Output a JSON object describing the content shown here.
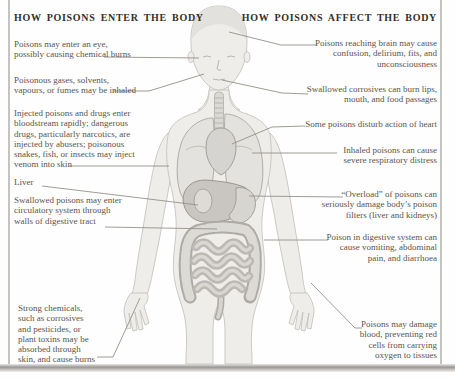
{
  "colors": {
    "page_background": "#fefefe",
    "frame_line": "#b3b1ae",
    "heading_text": "#332f29",
    "label_text": "#5a544a",
    "leader_line": "#95918a",
    "body_fill": "#efedea",
    "body_outline": "#c6c4c0",
    "organ_outline": "#9c9893",
    "organ_fill_light": "#dddbd6",
    "organ_fill_dark": "#c9c6c1"
  },
  "left_panel": {
    "heading": "HOW POISONS ENTER THE BODY",
    "items": [
      {
        "text": "Poisons may enter an eye,\npossibly causing chemical burns"
      },
      {
        "text": "Poisonous gases, solvents,\nvapours, or fumes may be inhaled"
      },
      {
        "text": "Injected poisons and drugs enter\nbloodstream rapidly; dangerous\ndrugs, particularly narcotics, are\ninjected by abusers; poisonous\nsnakes, fish, or insects may inject\nvenom into skin"
      },
      {
        "text": "Liver"
      },
      {
        "text": "Swallowed poisons may enter\ncirculatory system through\nwalls of digestive tract"
      },
      {
        "text": "Strong chemicals,\nsuch as corrosives\nand pesticides, or\nplant toxins may be\nabsorbed through\nskin, and cause burns"
      }
    ]
  },
  "right_panel": {
    "heading": "HOW POISONS AFFECT THE BODY",
    "items": [
      {
        "text": "Poisons reaching brain may cause\nconfusion, delirium, fits, and\nunconsciousness"
      },
      {
        "text": "Swallowed corrosives can burn lips,\nmouth, and food passages"
      },
      {
        "text": "Some poisons disturb action of heart"
      },
      {
        "text": "Inhaled poisons can cause\nsevere respiratory distress"
      },
      {
        "text": "“Overload” of poisons can\nseriously damage body’s poison\nfilters (liver and kidneys)"
      },
      {
        "text": "Poison in digestive system can\ncause vomiting, abdominal\npain, and diarrhoea"
      },
      {
        "text": "Poisons may damage\nblood, preventing red\ncells from carrying\noxygen to tissues"
      }
    ]
  }
}
